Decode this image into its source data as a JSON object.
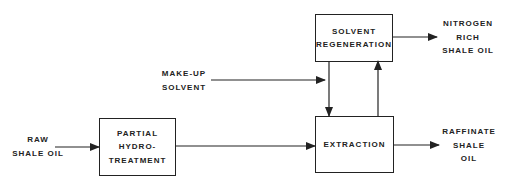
{
  "diagram": {
    "type": "process-flow",
    "inputs": {
      "raw_shale_oil": [
        "RAW",
        "SHALE OIL"
      ],
      "make_up_solvent": [
        "MAKE-UP",
        "SOLVENT"
      ]
    },
    "boxes": {
      "partial_hydrotreatment": [
        "PARTIAL",
        "HYDRO-",
        "TREATMENT"
      ],
      "solvent_regeneration": [
        "SOLVENT",
        "REGENERATION"
      ],
      "extraction": [
        "EXTRACTION"
      ]
    },
    "outputs": {
      "nitrogen_rich_shale_oil": [
        "NITROGEN",
        "RICH",
        "SHALE OIL"
      ],
      "raffinate_shale_oil": [
        "RAFFINATE",
        "SHALE",
        "OIL"
      ]
    },
    "edges": [
      {
        "from": "raw_shale_oil",
        "to": "partial_hydrotreatment"
      },
      {
        "from": "partial_hydrotreatment",
        "to": "extraction"
      },
      {
        "from": "make_up_solvent",
        "to": "extraction"
      },
      {
        "from": "solvent_regeneration",
        "to": "extraction"
      },
      {
        "from": "extraction",
        "to": "solvent_regeneration"
      },
      {
        "from": "solvent_regeneration",
        "to": "nitrogen_rich_shale_oil"
      },
      {
        "from": "extraction",
        "to": "raffinate_shale_oil"
      }
    ]
  }
}
